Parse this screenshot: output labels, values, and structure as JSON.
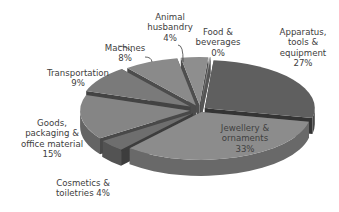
{
  "chart_data": {
    "type": "pie",
    "style": "3d-exploded",
    "title": "",
    "categories": [
      "Apparatus, tools & equipment",
      "Jewellery & ornaments",
      "Cosmetics & toiletries",
      "Goods, packaging & office material",
      "Transportation",
      "Machines",
      "Animal husbandry",
      "Food & beverages"
    ],
    "values": [
      27,
      33,
      4,
      15,
      9,
      8,
      4,
      0
    ],
    "unit": "%",
    "legend": "none (data labels with category name and percentage)",
    "colors": [
      "#5f5f5f",
      "#8c8c8c",
      "#6e6e6e",
      "#858585",
      "#7a7a7a",
      "#8a8a8a",
      "#8e8e8e",
      "#9a9a9a"
    ]
  },
  "labels": {
    "apparatus": "Apparatus,\ntools &\nequipment\n27%",
    "jewellery": "Jewellery &\nornaments\n33%",
    "cosmetics": "Cosmetics &\ntoiletries 4%",
    "goods": "Goods,\npackaging &\noffice material\n15%",
    "transportation": "Transportation\n9%",
    "machines": "Machines\n8%",
    "animal": "Animal\nhusbandry\n4%",
    "food": "Food &\nbeverages\n0%"
  }
}
